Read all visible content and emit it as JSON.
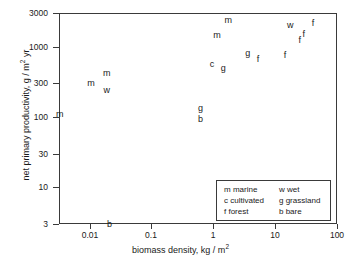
{
  "chart_data": {
    "type": "scatter",
    "title": "",
    "xlabel": "biomass density, kg / m²",
    "ylabel": "net primary productivity, g / m² yr",
    "xscale": "log",
    "yscale": "log",
    "xlim": [
      0.0032,
      100
    ],
    "ylim": [
      3,
      3000
    ],
    "grid": false,
    "xticks": [
      {
        "value": 0.01,
        "label": "0.01"
      },
      {
        "value": 0.1,
        "label": "0.1"
      },
      {
        "value": 1,
        "label": "1"
      },
      {
        "value": 10,
        "label": "10"
      },
      {
        "value": 100,
        "label": "100"
      }
    ],
    "yticks": [
      {
        "value": 3000,
        "label": "3000"
      },
      {
        "value": 1000,
        "label": "1000"
      },
      {
        "value": 300,
        "label": "300"
      },
      {
        "value": 100,
        "label": "100"
      },
      {
        "value": 30,
        "label": "30"
      },
      {
        "value": 10,
        "label": "10"
      },
      {
        "value": 3,
        "label": "3"
      }
    ],
    "marker_style": "letter-code",
    "points": [
      {
        "label": "m",
        "x": 0.0033,
        "y": 110
      },
      {
        "label": "m",
        "x": 0.0105,
        "y": 300
      },
      {
        "label": "m",
        "x": 0.019,
        "y": 420
      },
      {
        "label": "w",
        "x": 0.019,
        "y": 245
      },
      {
        "label": "b",
        "x": 0.021,
        "y": 3.05
      },
      {
        "label": "g",
        "x": 0.62,
        "y": 135
      },
      {
        "label": "b",
        "x": 0.62,
        "y": 92
      },
      {
        "label": "c",
        "x": 0.95,
        "y": 560
      },
      {
        "label": "m",
        "x": 1.15,
        "y": 1450
      },
      {
        "label": "g",
        "x": 1.45,
        "y": 500
      },
      {
        "label": "m",
        "x": 1.75,
        "y": 2400
      },
      {
        "label": "g",
        "x": 3.6,
        "y": 820
      },
      {
        "label": "f",
        "x": 5.3,
        "y": 660
      },
      {
        "label": "f",
        "x": 14.5,
        "y": 760
      },
      {
        "label": "w",
        "x": 17.5,
        "y": 2000
      },
      {
        "label": "f",
        "x": 25.0,
        "y": 1250
      },
      {
        "label": "f",
        "x": 29.0,
        "y": 1500
      },
      {
        "label": "f",
        "x": 41.0,
        "y": 2200
      }
    ],
    "legend": {
      "position": "lower-right",
      "entries": [
        {
          "code_label": "m marine",
          "pair_label": "w wet"
        },
        {
          "code_label": "c cultivated",
          "pair_label": "g grassland"
        },
        {
          "code_label": "f forest",
          "pair_label": "b bare"
        }
      ]
    }
  }
}
